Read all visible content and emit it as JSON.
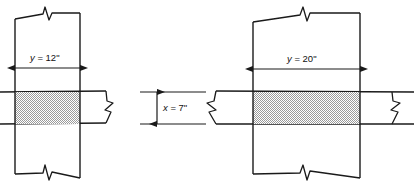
{
  "figure": {
    "background_color": "#ffffff",
    "line_color": "#1a1a1a",
    "shade_color": "#b9b9b9",
    "details": [
      {
        "id": "left-detail",
        "name": "narrow-column-detail",
        "column_width_label": "y = 12ʺ",
        "column_width_value": 12,
        "column_width_symbol": "y",
        "units": "in",
        "has_top_break": true,
        "has_bottom_break": true,
        "beam_break_sides": [
          "right"
        ]
      },
      {
        "id": "right-detail",
        "name": "wide-column-detail",
        "column_width_label": "y = 20ʺ",
        "column_width_value": 20,
        "column_width_symbol": "y",
        "units": "in",
        "has_top_break": true,
        "has_bottom_break": true,
        "beam_break_sides": [
          "left",
          "right"
        ]
      }
    ],
    "center_dimension": {
      "id": "beam-depth",
      "name": "beam-depth-dimension",
      "label": "x = 7ʺ",
      "value": 7,
      "symbol": "x",
      "units": "in",
      "orientation": "vertical"
    },
    "labels": {
      "left_width": {
        "symbol": "y",
        "equals": " = ",
        "value": "12ʺ"
      },
      "right_width": {
        "symbol": "y",
        "equals": " = ",
        "value": "20ʺ"
      },
      "beam_depth": {
        "symbol": "x",
        "equals": " = ",
        "value": "7ʺ"
      }
    }
  }
}
